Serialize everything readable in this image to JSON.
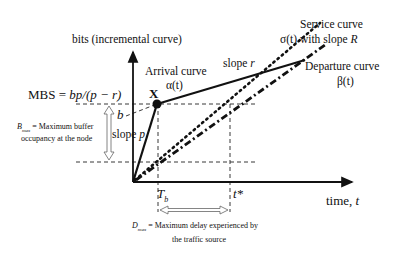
{
  "diagram": {
    "y_axis_label": "bits (incremental curve)",
    "x_axis_label": "time, ",
    "x_axis_var": "t",
    "mbs": {
      "prefix": "MBS = ",
      "formula": "bp/(p − r)"
    },
    "point_label": "X",
    "arrival": {
      "title": "Arrival curve",
      "symbol": "α(t)"
    },
    "slope_r": {
      "text": "slope ",
      "var": "r"
    },
    "slope_p": {
      "text": "slope ",
      "var": "p"
    },
    "b_label": "b",
    "service": {
      "line1": "Service curve",
      "line2_a": "σ(t) with slope ",
      "line2_var": "R"
    },
    "departure": {
      "title": "Departure curve",
      "symbol": "β(t)"
    },
    "bmax": {
      "sym": "B",
      "sub": "max",
      "line1_rest": " = Maximum buffer",
      "line2": "occupancy at the node"
    },
    "tb": {
      "sym": "T",
      "sub": "b"
    },
    "tstar": "t*",
    "dmax": {
      "sym": "D",
      "sub": "max",
      "line1_rest": " = Maximum delay experienced by",
      "line2": "the traffic source"
    },
    "colors": {
      "ink": "#111111",
      "background": "#ffffff"
    }
  }
}
